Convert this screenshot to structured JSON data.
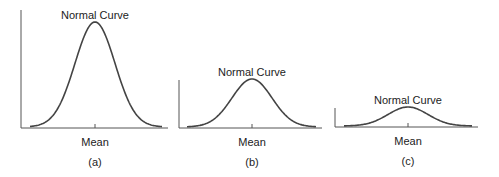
{
  "figure": {
    "panels": [
      {
        "id": "a",
        "title": "Normal Curve",
        "xlabel": "Mean",
        "caption": "(a)",
        "axis": {
          "x0": 21,
          "x1": 168,
          "ytop": 10,
          "ybase": 128
        },
        "curve": {
          "mean_x": 95,
          "sigma_px": 20,
          "peak_y": 22,
          "xstart": 30,
          "xend": 162
        },
        "title_pos": {
          "x": 95,
          "y": 19
        },
        "xlabel_pos": {
          "x": 95,
          "y": 146
        },
        "caption_pos": {
          "x": 95,
          "y": 166
        }
      },
      {
        "id": "b",
        "title": "Normal Curve",
        "xlabel": "Mean",
        "caption": "(b)",
        "axis": {
          "x0": 179,
          "x1": 322,
          "ytop": 80,
          "ybase": 128
        },
        "curve": {
          "mean_x": 252,
          "sigma_px": 20,
          "peak_y": 79,
          "xstart": 187,
          "xend": 316
        },
        "title_pos": {
          "x": 252,
          "y": 76
        },
        "xlabel_pos": {
          "x": 252,
          "y": 146
        },
        "caption_pos": {
          "x": 252,
          "y": 166
        }
      },
      {
        "id": "c",
        "title": "Normal Curve",
        "xlabel": "Mean",
        "caption": "(c)",
        "axis": {
          "x0": 335,
          "x1": 478,
          "ytop": 108,
          "ybase": 127
        },
        "curve": {
          "mean_x": 408,
          "sigma_px": 20,
          "peak_y": 107,
          "xstart": 344,
          "xend": 472
        },
        "title_pos": {
          "x": 408,
          "y": 104
        },
        "xlabel_pos": {
          "x": 408,
          "y": 145
        },
        "caption_pos": {
          "x": 408,
          "y": 165
        }
      }
    ],
    "colors": {
      "line": "#444444",
      "axis": "#555555",
      "text": "#222222",
      "background": "#ffffff"
    }
  }
}
